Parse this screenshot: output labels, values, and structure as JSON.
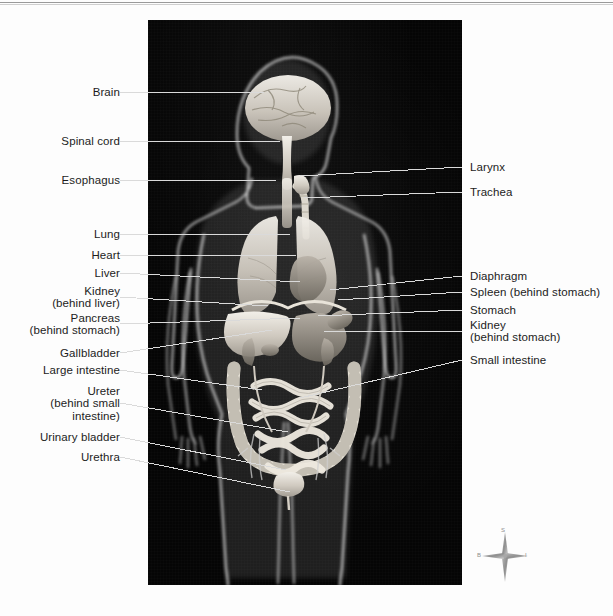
{
  "figure": {
    "panel": {
      "background_color": "#050505",
      "subject": "female-body-silhouette-with-internal-organs"
    },
    "left_labels": [
      {
        "id": "brain",
        "text": "Brain",
        "y": 92,
        "lines": 1
      },
      {
        "id": "spinal-cord",
        "text": "Spinal cord",
        "y": 141,
        "lines": 1
      },
      {
        "id": "esophagus",
        "text": "Esophagus",
        "y": 180,
        "lines": 1
      },
      {
        "id": "lung",
        "text": "Lung",
        "y": 234,
        "lines": 1
      },
      {
        "id": "heart",
        "text": "Heart",
        "y": 255,
        "lines": 1
      },
      {
        "id": "liver",
        "text": "Liver",
        "y": 273,
        "lines": 1
      },
      {
        "id": "kidney-liver",
        "text": "Kidney\n(behind liver)",
        "y": 291,
        "lines": 2
      },
      {
        "id": "pancreas",
        "text": "Pancreas\n(behind stomach)",
        "y": 318,
        "lines": 2
      },
      {
        "id": "gallbladder",
        "text": "Gallbladder",
        "y": 353,
        "lines": 1
      },
      {
        "id": "large-intestine",
        "text": "Large intestine",
        "y": 370,
        "lines": 1
      },
      {
        "id": "ureter",
        "text": "Ureter\n(behind small\nintestine)",
        "y": 391,
        "lines": 3
      },
      {
        "id": "urinary-bladder",
        "text": "Urinary bladder",
        "y": 437,
        "lines": 1
      },
      {
        "id": "urethra",
        "text": "Urethra",
        "y": 457,
        "lines": 1
      }
    ],
    "right_labels": [
      {
        "id": "larynx",
        "text": "Larynx",
        "y": 167,
        "lines": 1
      },
      {
        "id": "trachea",
        "text": "Trachea",
        "y": 192,
        "lines": 1
      },
      {
        "id": "diaphragm",
        "text": "Diaphragm",
        "y": 276,
        "lines": 1
      },
      {
        "id": "spleen",
        "text": "Spleen (behind stomach)",
        "y": 292,
        "lines": 1
      },
      {
        "id": "stomach",
        "text": "Stomach",
        "y": 310,
        "lines": 1
      },
      {
        "id": "kidney-stomach",
        "text": "Kidney\n(behind stomach)",
        "y": 325,
        "lines": 2
      },
      {
        "id": "small-intestine",
        "text": "Small intestine",
        "y": 360,
        "lines": 1
      }
    ],
    "compass": {
      "superior": "S",
      "left": "B",
      "right": "I"
    },
    "colors": {
      "panel_bg": "#050505",
      "page_bg": "#fdfdfd",
      "label_text": "#1c1c1c",
      "leader_line": "#d8d8d8",
      "rule": "#9a9a9a"
    }
  }
}
